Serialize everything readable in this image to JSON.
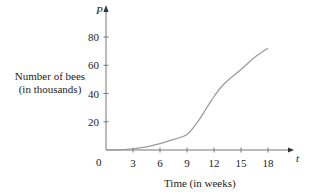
{
  "chart_data": {
    "type": "line",
    "title": "",
    "xlabel": "Time (in weeks)",
    "ylabel": "Number of bees\n(in thousands)",
    "x_axis_var": "t",
    "y_axis_var": "P",
    "origin_label": "0",
    "xticks": [
      3,
      6,
      9,
      12,
      15,
      18
    ],
    "yticks": [
      20,
      40,
      60,
      80
    ],
    "xlim": [
      0,
      20.5
    ],
    "ylim": [
      0,
      90
    ],
    "grid": false,
    "legend": null,
    "series": [
      {
        "name": "P(t)",
        "color": "#9a9a9a",
        "x": [
          0,
          1.5,
          3,
          4.5,
          6,
          7.5,
          9,
          10.3,
          11.7,
          13,
          15,
          16.6,
          18
        ],
        "y": [
          0,
          0.2,
          0.8,
          2.2,
          4.5,
          7.5,
          11,
          21,
          35,
          46,
          57,
          66,
          72
        ]
      }
    ]
  },
  "labels": {
    "ylabel_line1": "Number of bees",
    "ylabel_line2": "(in thousands)",
    "xlabel": "Time (in weeks)",
    "y_var": "P",
    "x_var": "t",
    "origin": "0"
  }
}
